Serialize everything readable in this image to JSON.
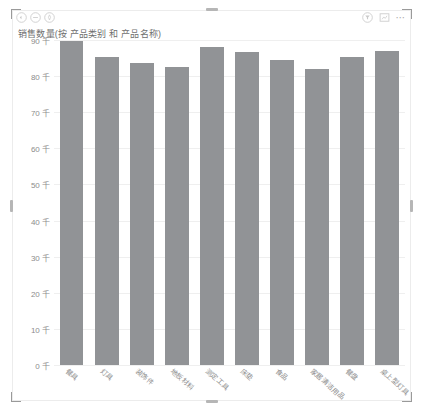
{
  "header": {
    "left_icons": [
      {
        "name": "revert-icon",
        "label": "撤销"
      },
      {
        "name": "minus-circle-icon",
        "label": "缩小"
      },
      {
        "name": "pin-circle-icon",
        "label": "固定"
      }
    ],
    "right_icons": [
      {
        "name": "filter-circle-icon",
        "label": "筛选器"
      },
      {
        "name": "focus-mode-icon",
        "label": "聚焦模式"
      },
      {
        "name": "more-options-icon",
        "label": "..."
      }
    ]
  },
  "chart_data": {
    "type": "bar",
    "title": "销售数量(按 产品类别 和 产品名称)",
    "xlabel": "",
    "ylabel": "",
    "ylim": [
      0,
      90
    ],
    "grid": true,
    "legend": false,
    "bar_color": "#919396",
    "unit_suffix": "千",
    "ytick_labels": [
      "90 千",
      "80 千",
      "70 千",
      "60 千",
      "50 千",
      "40 千",
      "30 千",
      "20 千",
      "10 千",
      "0 千"
    ],
    "ytick_values": [
      90,
      80,
      70,
      60,
      50,
      40,
      30,
      20,
      10,
      0
    ],
    "categories": [
      "餐具",
      "灯具",
      "装饰件",
      "地板材料",
      "测定工具",
      "床垫",
      "食品",
      "家居清洁用品",
      "餐盘",
      "桌上型灯具"
    ],
    "values": [
      89.6,
      85.2,
      83.6,
      82.6,
      88.2,
      86.8,
      84.6,
      82.0,
      85.4,
      87.0
    ]
  }
}
